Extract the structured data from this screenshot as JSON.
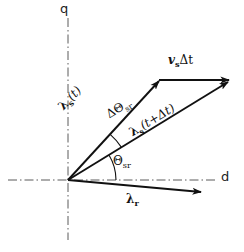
{
  "figure": {
    "background_color": "#ffffff",
    "ink_color": "#111111",
    "axis_color": "#4a4a4a",
    "width": 244,
    "height": 252
  },
  "axes": {
    "horizontal_label": "d",
    "vertical_label": "q",
    "line_style": "dash-dot",
    "origin": {
      "x": 68,
      "y": 180
    }
  },
  "vectors": [
    {
      "id": "lambda-s-t",
      "label_lambda": "λ",
      "label_sub": "s",
      "label_arg": "(t)",
      "label_full": "λₛ(t)",
      "from": {
        "x": 68,
        "y": 180
      },
      "to": {
        "x": 159,
        "y": 81
      },
      "rotation_deg": -47,
      "label_pos": {
        "x": 58,
        "y": 104
      }
    },
    {
      "id": "lambda-s-t-plus-dt",
      "label_lambda": "λ",
      "label_sub": "s",
      "label_arg": "(t+Δt)",
      "label_full": "λₛ(t+Δt)",
      "from": {
        "x": 68,
        "y": 180
      },
      "to": {
        "x": 228,
        "y": 82
      },
      "rotation_deg": -31,
      "label_pos": {
        "x": 128,
        "y": 128
      }
    },
    {
      "id": "v-s-delta-t",
      "label_v": "v",
      "label_sub": "s",
      "label_arg": "Δt",
      "label_full": "vₛΔt",
      "from": {
        "x": 159,
        "y": 81
      },
      "to": {
        "x": 228,
        "y": 82
      },
      "rotation_deg": 0,
      "label_pos": {
        "x": 168,
        "y": 58
      }
    },
    {
      "id": "lambda-r",
      "label_lambda": "λ",
      "label_sub": "r",
      "label_arg": "",
      "label_full": "λᵣ",
      "from": {
        "x": 68,
        "y": 180
      },
      "to": {
        "x": 201,
        "y": 192
      },
      "rotation_deg": 0,
      "label_pos": {
        "x": 126,
        "y": 196
      }
    }
  ],
  "angles": [
    {
      "id": "delta-theta-sr",
      "symbol": "ΔΘ",
      "sub": "sr",
      "label_full": "ΔΘₛᵣ",
      "rotation_deg": -31,
      "label_pos": {
        "x": 105,
        "y": 112
      },
      "arc_center": {
        "x": 68,
        "y": 180
      },
      "arc_radius": 62
    },
    {
      "id": "theta-sr",
      "symbol": "Θ",
      "sub": "sr",
      "label_full": "Θₛᵣ",
      "rotation_deg": 0,
      "label_pos": {
        "x": 113,
        "y": 158
      },
      "arc_center": {
        "x": 68,
        "y": 180
      },
      "arc_radius": 48
    }
  ]
}
